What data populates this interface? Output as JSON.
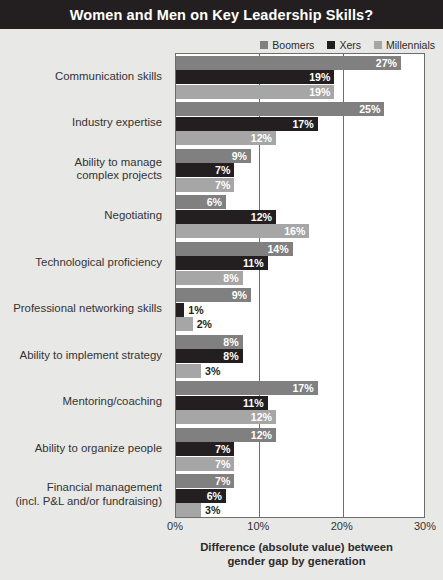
{
  "title": "Women and Men on Key Leadership Skills?",
  "colors": {
    "title_bar": "#231f20",
    "page_background": "#e8e8e6",
    "plot_background": "#ffffff",
    "axis_line": "#6d6d6d",
    "boomers": "#808080",
    "xers": "#231f20",
    "millennials": "#a6a6a6"
  },
  "legend": {
    "position": "top-right",
    "items": [
      {
        "label": "Boomers",
        "color": "#808080",
        "icon": "square-swatch-icon"
      },
      {
        "label": "Xers",
        "color": "#231f20",
        "icon": "square-swatch-icon"
      },
      {
        "label": "Millennials",
        "color": "#a6a6a6",
        "icon": "square-swatch-icon"
      }
    ]
  },
  "chart_data": {
    "type": "bar",
    "orientation": "horizontal",
    "title": "Women and Men on Key Leadership Skills?",
    "xlabel": "Difference (absolute value) between\ngender gap by generation",
    "ylabel": "",
    "xlim": [
      0,
      30
    ],
    "xticks": [
      0,
      10,
      20,
      30
    ],
    "xtick_labels": [
      "0%",
      "10%",
      "20%",
      "30%"
    ],
    "grid": "vertical",
    "value_suffix": "%",
    "legend_position": "top-right",
    "categories": [
      "Communication skills",
      "Industry expertise",
      "Ability to manage\ncomplex projects",
      "Negotiating",
      "Technological proficiency",
      "Professional networking skills",
      "Ability to implement strategy",
      "Mentoring/coaching",
      "Ability to organize people",
      "Financial management\n(incl. P&L and/or fundraising)"
    ],
    "series": [
      {
        "name": "Boomers",
        "color": "#808080",
        "values": [
          27,
          25,
          9,
          6,
          14,
          9,
          8,
          17,
          12,
          7
        ],
        "labels": [
          "27%",
          "25%",
          "9%",
          "6%",
          "14%",
          "9%",
          "8%",
          "17%",
          "12%",
          "7%"
        ]
      },
      {
        "name": "Xers",
        "color": "#231f20",
        "values": [
          19,
          17,
          7,
          12,
          11,
          1,
          8,
          11,
          7,
          6
        ],
        "labels": [
          "19%",
          "17%",
          "7%",
          "12%",
          "11%",
          "1%",
          "8%",
          "11%",
          "7%",
          "6%"
        ]
      },
      {
        "name": "Millennials",
        "color": "#a6a6a6",
        "values": [
          19,
          12,
          7,
          16,
          8,
          2,
          3,
          12,
          7,
          3
        ],
        "labels": [
          "19%",
          "12%",
          "7%",
          "16%",
          "8%",
          "2%",
          "3%",
          "12%",
          "7%",
          "3%"
        ]
      }
    ]
  }
}
